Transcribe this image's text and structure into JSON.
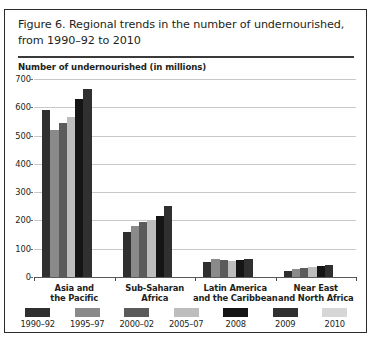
{
  "figure": {
    "title": "Figure 6. Regional trends in the number of undernourished, from 1990–92 to 2010",
    "title_line1": "Figure 6. Regional trends in the number of undernourished,",
    "title_line2": "from 1990–92 to 2010"
  },
  "chart_data": {
    "type": "bar",
    "title": "Figure 6. Regional trends in the number of undernourished, from 1990–92 to 2010",
    "xlabel": "",
    "ylabel": "Number of undernourished (in millions)",
    "ylim": [
      0,
      700
    ],
    "yticks": [
      0,
      100,
      200,
      300,
      400,
      500,
      600,
      700
    ],
    "grid": true,
    "legend_position": "bottom",
    "categories": [
      "Asia and the Pacific",
      "Sub-Saharan Africa",
      "Latin America and the Caribbean",
      "Near East and North Africa"
    ],
    "category_lines": [
      [
        "Asia and",
        "the Pacific"
      ],
      [
        "Sub-Saharan",
        "Africa"
      ],
      [
        "Latin America",
        "and the Caribbean"
      ],
      [
        "Near East",
        "and North Africa"
      ]
    ],
    "series": [
      {
        "name": "1990–92",
        "color": "#2f2f2f",
        "values": [
          590,
          160,
          54,
          20
        ]
      },
      {
        "name": "1995–97",
        "color": "#8a8a8a",
        "values": [
          520,
          180,
          62,
          28
        ]
      },
      {
        "name": "2000–02",
        "color": "#5b5b5b",
        "values": [
          545,
          195,
          59,
          32
        ]
      },
      {
        "name": "2005–07",
        "color": "#bdbdbd",
        "values": [
          565,
          200,
          56,
          35
        ]
      },
      {
        "name": "2008",
        "color": "#151515",
        "values": [
          630,
          215,
          60,
          39
        ]
      },
      {
        "name": "2009",
        "color": "#303030",
        "values": [
          665,
          250,
          65,
          42
        ]
      },
      {
        "name": "2010",
        "color": "#d6d6d6",
        "values": [
          null,
          null,
          null,
          null
        ]
      }
    ]
  },
  "legend": {
    "items": [
      {
        "label": "1990–92",
        "color": "#2f2f2f"
      },
      {
        "label": "1995–97",
        "color": "#8a8a8a"
      },
      {
        "label": "2000–02",
        "color": "#5b5b5b"
      },
      {
        "label": "2005–07",
        "color": "#bdbdbd"
      },
      {
        "label": "2008",
        "color": "#151515"
      },
      {
        "label": "2009",
        "color": "#303030"
      },
      {
        "label": "2010",
        "color": "#d6d6d6"
      }
    ]
  }
}
